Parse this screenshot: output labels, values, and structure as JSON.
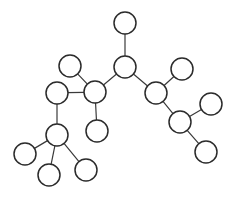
{
  "figure": {
    "kind": "undirected-graph-diagram",
    "title": "",
    "width": 233,
    "height": 197,
    "background_color": "#ffffff",
    "node_fill_color": "#ffffff",
    "node_stroke_color": "#2b2b2b",
    "node_stroke_width": 1.5,
    "node_radius": 11,
    "edge_color": "#3a3a3a",
    "edge_width": 1.2,
    "node_count": 17,
    "edge_count": 17
  },
  "chart_data": {
    "type": "diagram",
    "title": "",
    "xlabel": "",
    "ylabel": "",
    "nodes": [
      {
        "id": "n1",
        "label": "",
        "cx": 125,
        "cy": 23,
        "r": 11
      },
      {
        "id": "n2",
        "label": "",
        "cx": 125,
        "cy": 67,
        "r": 11
      },
      {
        "id": "n3",
        "label": "",
        "cx": 70,
        "cy": 66,
        "r": 11
      },
      {
        "id": "n4",
        "label": "",
        "cx": 95,
        "cy": 92,
        "r": 11
      },
      {
        "id": "n5",
        "label": "",
        "cx": 57,
        "cy": 93,
        "r": 11
      },
      {
        "id": "n6",
        "label": "",
        "cx": 97,
        "cy": 131,
        "r": 11
      },
      {
        "id": "n7",
        "label": "",
        "cx": 57,
        "cy": 135,
        "r": 11
      },
      {
        "id": "n8",
        "label": "",
        "cx": 25,
        "cy": 154,
        "r": 11
      },
      {
        "id": "n9",
        "label": "",
        "cx": 49,
        "cy": 175,
        "r": 11
      },
      {
        "id": "n10",
        "label": "",
        "cx": 86,
        "cy": 170,
        "r": 11
      },
      {
        "id": "n11",
        "label": "",
        "cx": 156,
        "cy": 93,
        "r": 11
      },
      {
        "id": "n12",
        "label": "",
        "cx": 182,
        "cy": 69,
        "r": 11
      },
      {
        "id": "n13",
        "label": "",
        "cx": 180,
        "cy": 122,
        "r": 11
      },
      {
        "id": "n14",
        "label": "",
        "cx": 211,
        "cy": 104,
        "r": 11
      },
      {
        "id": "n15",
        "label": "",
        "cx": 206,
        "cy": 152,
        "r": 11
      }
    ],
    "edges": [
      {
        "source": "n1",
        "target": "n2"
      },
      {
        "source": "n2",
        "target": "n4"
      },
      {
        "source": "n2",
        "target": "n11"
      },
      {
        "source": "n3",
        "target": "n4"
      },
      {
        "source": "n4",
        "target": "n5"
      },
      {
        "source": "n4",
        "target": "n6"
      },
      {
        "source": "n5",
        "target": "n7"
      },
      {
        "source": "n7",
        "target": "n8"
      },
      {
        "source": "n7",
        "target": "n9"
      },
      {
        "source": "n7",
        "target": "n10"
      },
      {
        "source": "n11",
        "target": "n12"
      },
      {
        "source": "n11",
        "target": "n13"
      },
      {
        "source": "n13",
        "target": "n14"
      },
      {
        "source": "n13",
        "target": "n15"
      }
    ]
  }
}
